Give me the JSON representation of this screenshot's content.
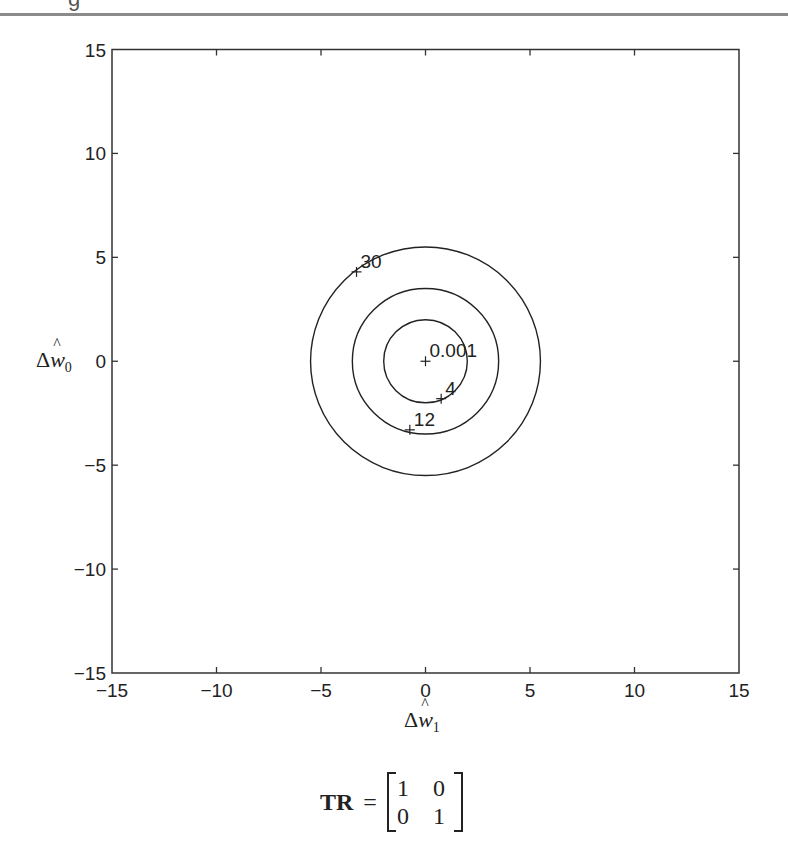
{
  "header": {
    "partial_text": "g"
  },
  "chart_data": {
    "type": "contour",
    "title": "",
    "xlabel": "Δŵ1",
    "ylabel": "Δŵ0",
    "xlim": [
      -15,
      15
    ],
    "ylim": [
      -15,
      15
    ],
    "xticks": [
      -15,
      -10,
      -5,
      0,
      5,
      10,
      15
    ],
    "yticks": [
      -15,
      -10,
      -5,
      0,
      5,
      10,
      15
    ],
    "grid": false,
    "center": [
      0,
      0
    ],
    "contours": [
      {
        "level": "4",
        "radius": 2.0
      },
      {
        "level": "12",
        "radius": 3.5
      },
      {
        "level": "30",
        "radius": 5.5
      }
    ],
    "markers": [
      {
        "label": "0.001",
        "x": 0.0,
        "y": 0.0
      },
      {
        "label": "4",
        "x": 0.75,
        "y": -1.8
      },
      {
        "label": "12",
        "x": -0.75,
        "y": -3.3
      },
      {
        "label": "30",
        "x": -3.3,
        "y": 4.3
      }
    ]
  },
  "labels": {
    "x_axis": {
      "symbol": "Δ",
      "var": "w",
      "sub": "1"
    },
    "y_axis": {
      "symbol": "Δ",
      "var": "w",
      "sub": "0"
    },
    "ticks": [
      "-15",
      "-10",
      "-5",
      "0",
      "5",
      "10",
      "15"
    ],
    "contour_labels": [
      "0.001",
      "4",
      "12",
      "30"
    ]
  },
  "caption": {
    "lhs": "TR",
    "eq": "=",
    "matrix": [
      [
        "1",
        "0"
      ],
      [
        "0",
        "1"
      ]
    ]
  }
}
